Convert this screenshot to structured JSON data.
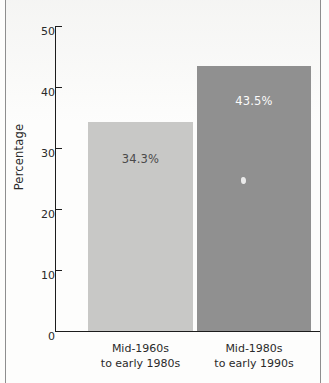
{
  "chart_data": {
    "type": "bar",
    "title": "",
    "xlabel": "",
    "ylabel": "Percentage",
    "categories": [
      "Mid-1960s to early 1980s",
      "Mid-1980s to early 1990s"
    ],
    "category_lines": [
      [
        "Mid-1960s",
        "to early 1980s"
      ],
      [
        "Mid-1980s",
        "to early 1990s"
      ]
    ],
    "values": [
      34.3,
      43.5
    ],
    "value_labels": [
      "34.3%",
      "43.5%"
    ],
    "ylim": [
      0,
      50
    ],
    "yticks": [
      0,
      10,
      20,
      30,
      40,
      50
    ],
    "ytick_labels": [
      "0",
      "10",
      "20",
      "30",
      "40",
      "50"
    ],
    "grid": false,
    "legend": false,
    "bar_colors": [
      "#c8c8c6",
      "#909090"
    ],
    "axis_color": "#1c1c1c",
    "background": "#fdfdfc"
  }
}
